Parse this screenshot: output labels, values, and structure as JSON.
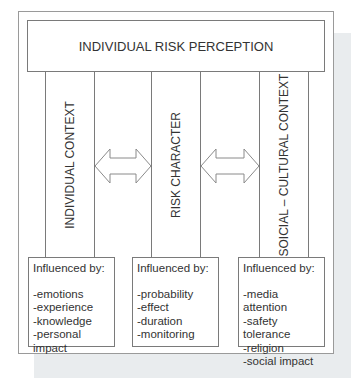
{
  "title": "INDIVIDUAL RISK PERCEPTION",
  "columns": [
    {
      "label": "INDIVIDUAL CONTEXT"
    },
    {
      "label": "RISK CHARACTER"
    },
    {
      "label": "SOICIAL – CULTURAL CONTEXT"
    }
  ],
  "factors": [
    {
      "heading": "Influenced by:",
      "items": [
        "-emotions",
        "-experience",
        "-knowledge",
        "-personal impact"
      ]
    },
    {
      "heading": "Influenced by:",
      "items": [
        "-probability",
        "-effect",
        "-duration",
        "-monitoring"
      ]
    },
    {
      "heading": "Influenced by:",
      "items": [
        "-media attention",
        "-safety tolerance",
        "-religion",
        "-social impact"
      ]
    }
  ],
  "arrows": [
    {
      "from": "INDIVIDUAL CONTEXT",
      "to": "RISK CHARACTER",
      "type": "double-headed"
    },
    {
      "from": "RISK CHARACTER",
      "to": "SOICIAL – CULTURAL CONTEXT",
      "type": "double-headed"
    }
  ]
}
